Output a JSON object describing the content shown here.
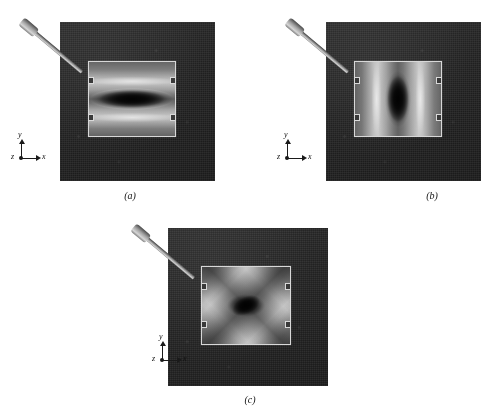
{
  "figure": {
    "type": "photomicrograph-panel-set",
    "panel_count": 3,
    "panels": [
      {
        "id": "a",
        "caption": "(a)",
        "pattern": "horizontal lens / elliptical fringe",
        "axes": {
          "y": "y",
          "x": "x",
          "z": "z"
        },
        "probe": "loading-arm",
        "background_color": "#262626",
        "plate_color": "#9a9a9a"
      },
      {
        "id": "b",
        "caption": "(b)",
        "pattern": "vertical lens / elliptical fringe",
        "axes": {
          "y": "y",
          "x": "x",
          "z": "z"
        },
        "probe": "loading-arm",
        "background_color": "#262626",
        "plate_color": "#9a9a9a"
      },
      {
        "id": "c",
        "caption": "(c)",
        "pattern": "diagonal rotated lens / diamond fringe",
        "axes": {
          "y": "y",
          "x": "x",
          "z": "z"
        },
        "probe": "loading-arm",
        "background_color": "#262626",
        "plate_color": "#9a9a9a"
      }
    ]
  }
}
